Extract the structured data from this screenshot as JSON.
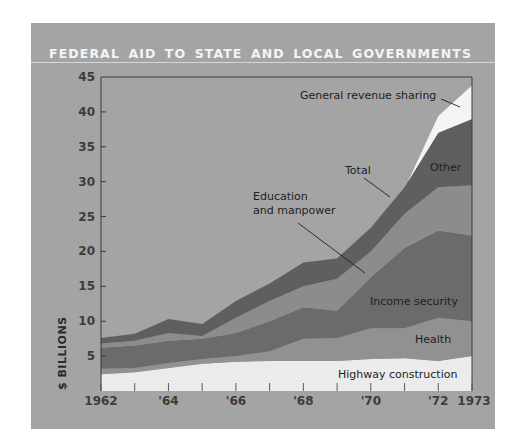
{
  "title": "FEDERAL AID TO STATE AND LOCAL GOVERNMENTS",
  "colors": {
    "page_bg": "#ffffff",
    "panel_bg": "#a4a4a4",
    "general_revenue_sharing": "#f4f4f4",
    "other": "#5f5f5f",
    "education_and_manpower": "#8c8c8c",
    "income_security": "#6b6b6b",
    "health": "#919191",
    "highway_construction": "#ebebeb"
  },
  "chart_data": {
    "type": "area",
    "stacked": true,
    "title": "FEDERAL AID TO STATE AND LOCAL GOVERNMENTS",
    "xlabel": "",
    "ylabel": "$ BILLIONS",
    "x": [
      1962,
      1963,
      1964,
      1965,
      1966,
      1967,
      1968,
      1969,
      1970,
      1971,
      1972,
      1973
    ],
    "x_tick_labels": [
      {
        "x": 1962,
        "label": "1962"
      },
      {
        "x": 1964,
        "label": "'64"
      },
      {
        "x": 1966,
        "label": "'66"
      },
      {
        "x": 1968,
        "label": "'68"
      },
      {
        "x": 1970,
        "label": "'70"
      },
      {
        "x": 1972,
        "label": "'72"
      },
      {
        "x": 1973,
        "label": "1973"
      }
    ],
    "y_ticks": [
      5,
      10,
      15,
      20,
      25,
      30,
      35,
      40,
      45
    ],
    "ylim": [
      0,
      45
    ],
    "xlim": [
      1962,
      1973
    ],
    "grid": false,
    "legend": "inline labels",
    "series": [
      {
        "name": "Highway construction",
        "color_key": "highway_construction",
        "values": [
          2.4,
          2.7,
          3.3,
          3.9,
          4.2,
          4.3,
          4.3,
          4.3,
          4.6,
          4.7,
          4.3,
          5.0
        ]
      },
      {
        "name": "Health",
        "color_key": "health",
        "values": [
          0.8,
          0.6,
          0.7,
          0.7,
          0.8,
          1.4,
          3.2,
          3.3,
          4.4,
          4.3,
          6.2,
          5.0
        ]
      },
      {
        "name": "Income security",
        "color_key": "income_security",
        "values": [
          3.0,
          3.2,
          3.2,
          2.9,
          3.3,
          4.3,
          4.5,
          3.9,
          7.3,
          11.5,
          12.5,
          12.3
        ]
      },
      {
        "name": "Education and manpower",
        "color_key": "education_and_manpower",
        "values": [
          0.6,
          0.7,
          1.1,
          0.4,
          2.2,
          2.9,
          3.0,
          4.6,
          3.7,
          4.9,
          6.2,
          7.2
        ]
      },
      {
        "name": "Other",
        "color_key": "other",
        "values": [
          0.8,
          1.0,
          2.0,
          1.7,
          2.4,
          2.5,
          3.4,
          2.9,
          3.4,
          3.8,
          7.8,
          9.5
        ]
      },
      {
        "name": "General revenue sharing",
        "color_key": "general_revenue_sharing",
        "values": [
          0,
          0,
          0,
          0,
          0,
          0,
          0,
          0,
          0,
          0,
          2.4,
          4.8
        ]
      }
    ],
    "total": [
      7.6,
      8.2,
      10.3,
      9.6,
      12.9,
      15.4,
      18.4,
      19.0,
      23.4,
      29.2,
      39.4,
      43.8
    ],
    "annotations": [
      {
        "text": "General revenue sharing",
        "anchor_series": "General revenue sharing"
      },
      {
        "text": "Total",
        "anchor_series": "Total"
      },
      {
        "text": "Other",
        "anchor_series": "Other"
      },
      {
        "text": "Education",
        "anchor_series": "Education and manpower"
      },
      {
        "text": "and manpower",
        "anchor_series": "Education and manpower"
      },
      {
        "text": "Income security",
        "anchor_series": "Income security"
      },
      {
        "text": "Health",
        "anchor_series": "Health"
      },
      {
        "text": "Highway construction",
        "anchor_series": "Highway construction"
      }
    ]
  },
  "labels": {
    "y_axis": "$ BILLIONS",
    "grs": "General revenue sharing",
    "total": "Total",
    "other": "Other",
    "educ_line1": "Education",
    "educ_line2": "and manpower",
    "income": "Income security",
    "health": "Health",
    "highway": "Highway construction"
  }
}
